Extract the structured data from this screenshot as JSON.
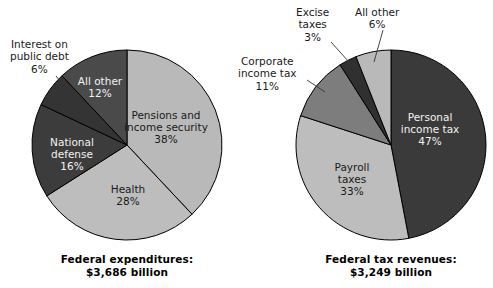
{
  "figure": {
    "width": 493,
    "height": 288,
    "background": "#ffffff"
  },
  "palette": {
    "light_gray": "#b9b9b9",
    "light_gray_alt": "#bdbdbd",
    "medium_gray": "#7d7d7d",
    "dark_gray": "#4a4a4a",
    "very_dark": "#323232",
    "outline": "#000000",
    "text_on_dark": "#f2f2f2",
    "text_on_light": "#1a1a1a",
    "leader_line": "#333333"
  },
  "charts": [
    {
      "id": "federal-expenditures",
      "caption_line1": "Federal expenditures:",
      "caption_line2": "$3,686 billion",
      "center": {
        "x": 127,
        "y": 145
      },
      "radius": 95,
      "slices": [
        {
          "name": "pensions-and-income-security",
          "label_line1": "Pensions and",
          "label_line2": "income security",
          "value_label": "38%",
          "value": 38,
          "color": "#b9b9b9",
          "label_placement": "inside",
          "label_on": "light",
          "label_x": 166,
          "label_y": 128
        },
        {
          "name": "health",
          "label_line1": "Health",
          "label_line2": "",
          "value_label": "28%",
          "value": 28,
          "color": "#bdbdbd",
          "label_placement": "inside",
          "label_on": "light",
          "label_x": 128,
          "label_y": 196
        },
        {
          "name": "national-defense",
          "label_line1": "National",
          "label_line2": "defense",
          "value_label": "16%",
          "value": 16,
          "color": "#3c3c3c",
          "label_placement": "inside",
          "label_on": "dark",
          "label_x": 72,
          "label_y": 155
        },
        {
          "name": "interest-on-public-debt",
          "label_line1": "Interest on",
          "label_line2": "public debt",
          "value_label": "6%",
          "value": 6,
          "color": "#343434",
          "label_placement": "outside",
          "label_on": "light",
          "label_x": 10,
          "label_y": 38,
          "leader": {
            "x1": 56,
            "y1": 76,
            "x2": 72,
            "y2": 96
          }
        },
        {
          "name": "all-other-expenditures",
          "label_line1": "All other",
          "label_line2": "",
          "value_label": "12%",
          "value": 12,
          "color": "#4a4a4a",
          "label_placement": "inside",
          "label_on": "dark",
          "label_x": 100,
          "label_y": 88
        }
      ]
    },
    {
      "id": "federal-tax-revenues",
      "caption_line1": "Federal tax revenues:",
      "caption_line2": "$3,249 billion",
      "center": {
        "x": 391,
        "y": 145
      },
      "radius": 95,
      "slices": [
        {
          "name": "personal-income-tax",
          "label_line1": "Personal",
          "label_line2": "income tax",
          "value_label": "47%",
          "value": 47,
          "color": "#3a3a3a",
          "label_placement": "inside",
          "label_on": "dark",
          "label_x": 430,
          "label_y": 130
        },
        {
          "name": "payroll-taxes",
          "label_line1": "Payroll",
          "label_line2": "taxes",
          "value_label": "33%",
          "value": 33,
          "color": "#bdbdbd",
          "label_placement": "inside",
          "label_on": "light",
          "label_x": 352,
          "label_y": 180
        },
        {
          "name": "corporate-income-tax",
          "label_line1": "Corporate",
          "label_line2": "income tax",
          "value_label": "11%",
          "value": 11,
          "color": "#7d7d7d",
          "label_placement": "outside",
          "label_on": "light",
          "label_x": 238,
          "label_y": 55,
          "leader": {
            "x1": 307,
            "y1": 80,
            "x2": 325,
            "y2": 92
          }
        },
        {
          "name": "excise-taxes",
          "label_line1": "Excise",
          "label_line2": "taxes",
          "value_label": "3%",
          "value": 3,
          "color": "#303030",
          "label_placement": "outside",
          "label_x": 296,
          "label_y": 6,
          "label_on": "light",
          "leader": {
            "x1": 331,
            "y1": 42,
            "x2": 349,
            "y2": 62
          }
        },
        {
          "name": "all-other-revenues",
          "label_line1": "All other",
          "label_line2": "",
          "value_label": "6%",
          "value": 6,
          "color": "#b9b9b9",
          "label_placement": "outside",
          "label_x": 355,
          "label_y": 6,
          "label_on": "light",
          "leader": {
            "x1": 383,
            "y1": 30,
            "x2": 374,
            "y2": 62
          }
        }
      ]
    }
  ],
  "chart_data": {
    "type": "pie",
    "title": "",
    "subtitle": "",
    "legend": "none",
    "charts": [
      {
        "title": "Federal expenditures: $3,686 billion",
        "total_label": "$3,686 billion",
        "unit": "percent of total",
        "start_angle_deg": 0,
        "direction": "clockwise",
        "labels": [
          "Pensions and income security",
          "Health",
          "National defense",
          "Interest on public debt",
          "All other"
        ],
        "values": [
          38,
          28,
          16,
          6,
          12
        ],
        "colors": [
          "#b9b9b9",
          "#bdbdbd",
          "#3c3c3c",
          "#343434",
          "#4a4a4a"
        ]
      },
      {
        "title": "Federal tax revenues: $3,249 billion",
        "total_label": "$3,249 billion",
        "unit": "percent of total",
        "start_angle_deg": 0,
        "direction": "clockwise",
        "labels": [
          "Personal income tax",
          "Payroll taxes",
          "Corporate income tax",
          "Excise taxes",
          "All other"
        ],
        "values": [
          47,
          33,
          11,
          3,
          6
        ],
        "colors": [
          "#3a3a3a",
          "#bdbdbd",
          "#7d7d7d",
          "#303030",
          "#b9b9b9"
        ]
      }
    ]
  },
  "captions": {
    "left": {
      "line1": "Federal expenditures:",
      "line2": "$3,686 billion",
      "x": 127,
      "y": 253
    },
    "right": {
      "line1": "Federal tax revenues:",
      "line2": "$3,249 billion",
      "x": 391,
      "y": 253
    }
  }
}
